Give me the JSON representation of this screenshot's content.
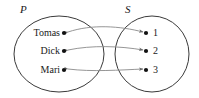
{
  "figure": {
    "type": "set-mapping-diagram",
    "width": 199,
    "height": 98,
    "background_color": "#ffffff",
    "stroke_color": "#3a3a3a",
    "dot_color": "#111111",
    "text_color": "#1a1a1a"
  },
  "sets": {
    "domain": {
      "label": "P",
      "label_x": 20,
      "label_y": 4,
      "ellipse": {
        "cx": 59,
        "cy": 54,
        "rx": 45,
        "ry": 38
      },
      "elements": [
        {
          "text": "Tomas",
          "dot_x": 64,
          "dot_y": 33,
          "label_x": 60,
          "label_y": 33
        },
        {
          "text": "Dick",
          "dot_x": 64,
          "dot_y": 51,
          "label_x": 60,
          "label_y": 51
        },
        {
          "text": "Mari",
          "dot_x": 64,
          "dot_y": 70,
          "label_x": 60,
          "label_y": 70
        }
      ]
    },
    "codomain": {
      "label": "S",
      "label_x": 125,
      "label_y": 4,
      "ellipse": {
        "cx": 152,
        "cy": 54,
        "rx": 37,
        "ry": 38
      },
      "elements": [
        {
          "text": "1",
          "dot_x": 146,
          "dot_y": 33,
          "label_x": 153,
          "label_y": 33
        },
        {
          "text": "2",
          "dot_x": 146,
          "dot_y": 51,
          "label_x": 153,
          "label_y": 51
        },
        {
          "text": "3",
          "dot_x": 146,
          "dot_y": 70,
          "label_x": 153,
          "label_y": 70
        }
      ]
    }
  },
  "mappings": [
    {
      "from": "Tomas",
      "to": "1",
      "path": "M 68 32 C 92 24, 120 26, 143 32",
      "arrow_both": true
    },
    {
      "from": "Dick",
      "to": "2",
      "path": "M 68 50 C 92 45, 120 46, 143 50",
      "arrow_both": true
    },
    {
      "from": "Mari",
      "to": "3",
      "path": "M 68 69 C 92 72, 120 70, 143 69",
      "arrow_both": true
    }
  ]
}
